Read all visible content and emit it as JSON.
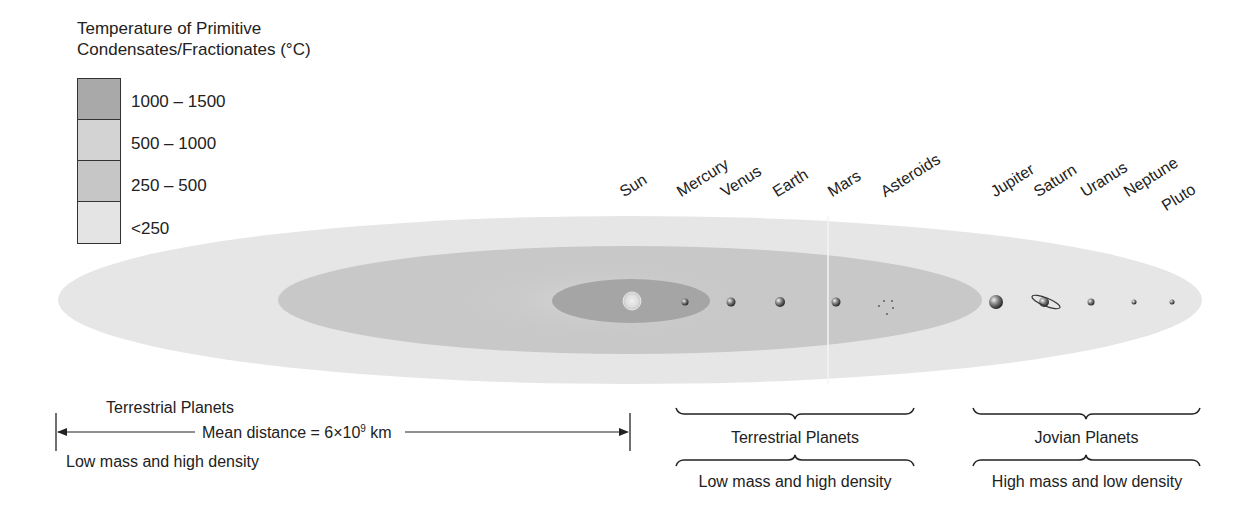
{
  "legend": {
    "title_line1": "Temperature of Primitive",
    "title_line2": "Condensates/Fractionates (°C)",
    "items": [
      {
        "label": "1000 – 1500",
        "color": "#a9a9a9"
      },
      {
        "label": "500 – 1000",
        "color": "#d3d3d3"
      },
      {
        "label": "250 – 500",
        "color": "#c6c6c6"
      },
      {
        "label": "<250",
        "color": "#e4e4e4"
      }
    ]
  },
  "zones": {
    "outer_color": "#e6e6e6",
    "middle_color": "#c8c8c8",
    "halo_color": "#d4d4d4",
    "inner_color": "#a5a5a5"
  },
  "bodies": [
    {
      "name": "Sun",
      "x": 631
    },
    {
      "name": "Mercury",
      "x": 685
    },
    {
      "name": "Venus",
      "x": 731
    },
    {
      "name": "Earth",
      "x": 780
    },
    {
      "name": "Mars",
      "x": 836
    },
    {
      "name": "Asteroids",
      "x": 886
    },
    {
      "name": "Jupiter",
      "x": 995
    },
    {
      "name": "Saturn",
      "x": 1045
    },
    {
      "name": "Uranus",
      "x": 1091
    },
    {
      "name": "Neptune",
      "x": 1134
    },
    {
      "name": "Pluto",
      "x": 1172
    }
  ],
  "bottom_left": {
    "title": "Terrestrial Planets",
    "distance_label": "Mean distance = 6×10",
    "distance_exponent": "9",
    "distance_unit": " km",
    "subtitle": "Low mass and high density"
  },
  "groups": [
    {
      "title": "Terrestrial Planets",
      "subtitle": "Low mass and high density"
    },
    {
      "title": "Jovian Planets",
      "subtitle": "High mass and low density"
    }
  ]
}
